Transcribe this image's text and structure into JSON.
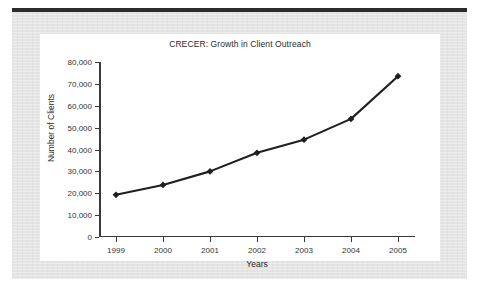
{
  "chart_data": {
    "type": "line",
    "title": "CRECER: Growth in Client Outreach",
    "xlabel": "Years",
    "ylabel": "Number of Clients",
    "categories": [
      "1999",
      "2000",
      "2001",
      "2002",
      "2003",
      "2004",
      "2005"
    ],
    "x": [
      1999,
      2000,
      2001,
      2002,
      2003,
      2004,
      2005
    ],
    "values": [
      19300,
      23800,
      30000,
      38500,
      44500,
      54000,
      73500
    ],
    "series": [
      {
        "name": "Number of Clients",
        "values": [
          19300,
          23800,
          30000,
          38500,
          44500,
          54000,
          73500
        ]
      }
    ],
    "ylim": [
      0,
      80000
    ],
    "ytick_values": [
      0,
      10000,
      20000,
      30000,
      40000,
      50000,
      60000,
      70000,
      80000
    ],
    "ytick_labels": [
      "0",
      "10,000",
      "20,000",
      "30,000",
      "40,000",
      "50,000",
      "60,000",
      "70,000",
      "80,000"
    ],
    "xtick_labels": [
      "1999",
      "2000",
      "2001",
      "2002",
      "2003",
      "2004",
      "2005"
    ],
    "grid": false,
    "legend": "none",
    "marker": "diamond",
    "line_color": "#1f1f1f",
    "marker_color": "#1f1f1f",
    "plot_background": "#ffffff",
    "page_background": "#e4e4e4"
  }
}
